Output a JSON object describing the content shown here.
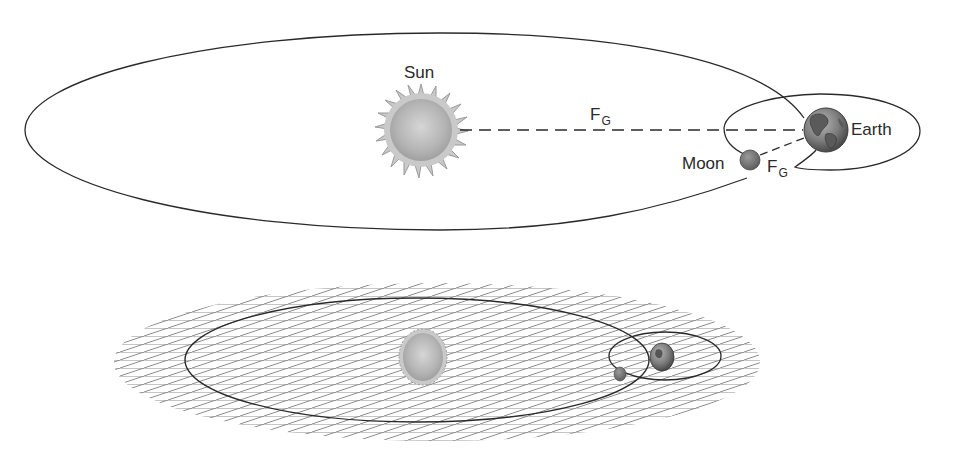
{
  "figure": {
    "top_diagram": {
      "labels": {
        "sun": "Sun",
        "earth": "Earth",
        "moon": "Moon",
        "force_sun_earth": {
          "main": "F",
          "sub": "G"
        },
        "force_earth_moon": {
          "main": "F",
          "sub": "G"
        }
      },
      "bodies": {
        "sun": {
          "cx": 421,
          "cy": 130,
          "r": 35
        },
        "earth": {
          "cx": 826,
          "cy": 130,
          "r": 22
        },
        "moon": {
          "cx": 750,
          "cy": 160,
          "r": 10
        }
      }
    },
    "bottom_diagram": {
      "description": "Perspective view of the same Sun-Earth-Moon system lying in a hatched orbital plane",
      "bodies": {
        "sun": {
          "cx": 423,
          "cy": 357
        },
        "earth": {
          "cx": 662,
          "cy": 357
        },
        "moon": {
          "cx": 620,
          "cy": 374
        }
      }
    },
    "colors": {
      "line": "#2a2a2a",
      "sun_fill": "#b8b8b8",
      "sun_corona": "#c9c9c9",
      "earth_fill": "#8a8a8a",
      "moon_fill": "#7a7a7a",
      "hatch": "#8c8c8c",
      "background": "#ffffff"
    }
  }
}
